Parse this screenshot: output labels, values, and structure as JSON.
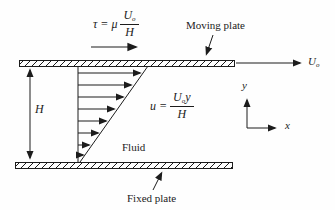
{
  "diagram": {
    "background": "#fefefe",
    "line_color": "#1c1c1c",
    "formulas": {
      "shear": {
        "lhs": "τ = μ",
        "numerator_base": "U",
        "numerator_sub": "o",
        "denominator": "H"
      },
      "velocity": {
        "lhs": "u =",
        "numerator_base": "U",
        "numerator_sub": "o",
        "numerator_var": "y",
        "denominator": "H"
      }
    },
    "labels": {
      "moving_plate": "Moving plate",
      "fixed_plate": "Fixed plate",
      "fluid": "Fluid",
      "gap_height": "H",
      "plate_velocity_base": "U",
      "plate_velocity_sub": "o",
      "axis_x": "x",
      "axis_y": "y"
    }
  }
}
